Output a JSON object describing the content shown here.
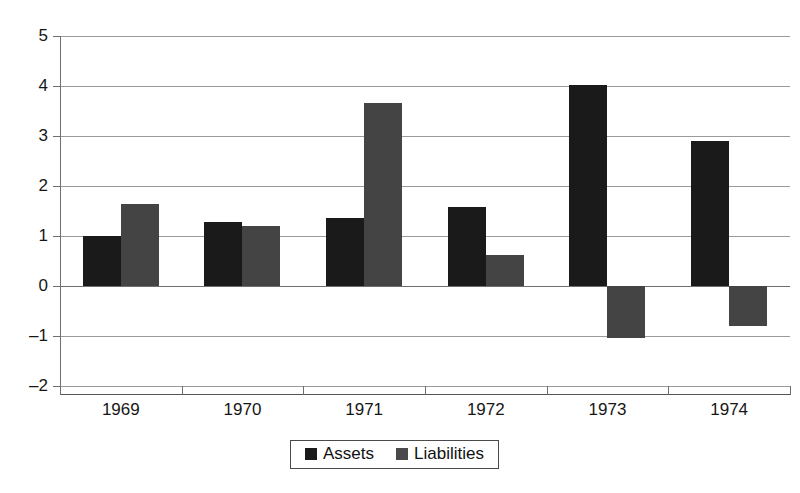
{
  "chart_data": {
    "type": "bar",
    "title": "",
    "subtitle": "",
    "xlabel": "",
    "ylabel": "",
    "categories": [
      "1969",
      "1970",
      "1971",
      "1972",
      "1973",
      "1974"
    ],
    "series": [
      {
        "name": "Assets",
        "color": "#1a1a1a",
        "values": [
          1.0,
          1.28,
          1.37,
          1.58,
          4.02,
          2.9
        ]
      },
      {
        "name": "Liabilities",
        "color": "#444444",
        "values": [
          1.65,
          1.21,
          3.67,
          0.63,
          -1.03,
          -0.8
        ]
      }
    ],
    "ylim": [
      -2,
      5
    ],
    "ytick_labels": [
      "5",
      "4",
      "3",
      "2",
      "1",
      "0",
      "-1",
      "-2"
    ],
    "ytick_values": [
      5,
      4,
      3,
      2,
      1,
      0,
      -1,
      -2
    ],
    "grid": true,
    "legend_position": "bottom-center"
  },
  "legend": {
    "items": [
      {
        "label": "Assets",
        "swatch": "assets-swatch-icon"
      },
      {
        "label": "Liabilities",
        "swatch": "liabilities-swatch-icon"
      }
    ]
  }
}
